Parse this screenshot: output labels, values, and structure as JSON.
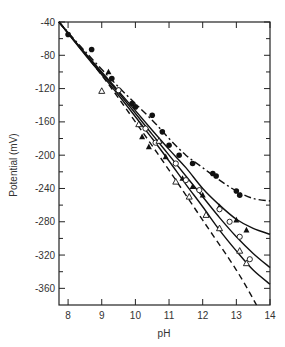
{
  "chart_data": {
    "type": "scatter",
    "title": "",
    "xlabel": "pH",
    "ylabel": "Potential (mV)",
    "xlim": [
      7.73,
      14
    ],
    "ylim": [
      -380,
      -40
    ],
    "xticks": [
      8,
      9,
      10,
      11,
      12,
      13,
      14
    ],
    "yticks": [
      -40,
      -80,
      -120,
      -160,
      -200,
      -240,
      -280,
      -320,
      -360
    ],
    "grid": false,
    "legend": null,
    "series": [
      {
        "name": "filled circles",
        "marker": "filled-circle",
        "points": [
          [
            8.0,
            -55
          ],
          [
            8.7,
            -73
          ],
          [
            9.3,
            -108
          ],
          [
            9.5,
            -122
          ],
          [
            9.9,
            -138
          ],
          [
            10.0,
            -142
          ],
          [
            10.5,
            -152
          ],
          [
            10.8,
            -172
          ],
          [
            11.0,
            -188
          ],
          [
            11.3,
            -200
          ],
          [
            11.7,
            -210
          ],
          [
            12.3,
            -222
          ],
          [
            12.4,
            -225
          ],
          [
            13.0,
            -243
          ],
          [
            13.1,
            -248
          ]
        ],
        "curve": {
          "style": "dash-dot",
          "points": [
            [
              7.73,
              -40
            ],
            [
              8.5,
              -75
            ],
            [
              9.5,
              -118
            ],
            [
              10.5,
              -158
            ],
            [
              11.0,
              -180
            ],
            [
              11.5,
              -200
            ],
            [
              12.0,
              -215
            ],
            [
              12.5,
              -230
            ],
            [
              13.0,
              -243
            ],
            [
              13.5,
              -252
            ],
            [
              14.0,
              -255
            ]
          ]
        }
      },
      {
        "name": "filled triangles",
        "marker": "filled-triangle",
        "points": [
          [
            9.2,
            -100
          ],
          [
            10.2,
            -178
          ],
          [
            10.4,
            -190
          ],
          [
            10.9,
            -202
          ],
          [
            11.4,
            -228
          ],
          [
            11.7,
            -238
          ],
          [
            12.0,
            -248
          ],
          [
            12.5,
            -262
          ],
          [
            13.0,
            -278
          ],
          [
            13.3,
            -290
          ]
        ],
        "curve": {
          "style": "solid",
          "points": [
            [
              7.73,
              -40
            ],
            [
              8.5,
              -77
            ],
            [
              9.5,
              -123
            ],
            [
              10.5,
              -170
            ],
            [
              11.0,
              -193
            ],
            [
              11.5,
              -215
            ],
            [
              12.0,
              -240
            ],
            [
              12.5,
              -260
            ],
            [
              13.0,
              -277
            ],
            [
              13.5,
              -288
            ],
            [
              14.0,
              -295
            ]
          ]
        }
      },
      {
        "name": "open circles",
        "marker": "open-circle",
        "points": [
          [
            9.5,
            -122
          ],
          [
            10.3,
            -168
          ],
          [
            10.6,
            -185
          ],
          [
            11.2,
            -210
          ],
          [
            11.5,
            -230
          ],
          [
            11.9,
            -242
          ],
          [
            12.5,
            -265
          ],
          [
            12.8,
            -280
          ],
          [
            13.1,
            -298
          ],
          [
            13.4,
            -325
          ]
        ],
        "curve": {
          "style": "solid",
          "points": [
            [
              7.73,
              -40
            ],
            [
              8.5,
              -78
            ],
            [
              9.5,
              -125
            ],
            [
              10.5,
              -175
            ],
            [
              11.0,
              -200
            ],
            [
              11.5,
              -225
            ],
            [
              12.0,
              -250
            ],
            [
              12.5,
              -275
            ],
            [
              13.0,
              -298
            ],
            [
              13.5,
              -318
            ],
            [
              14.0,
              -335
            ]
          ]
        }
      },
      {
        "name": "open triangles",
        "marker": "open-triangle",
        "points": [
          [
            9.0,
            -123
          ],
          [
            10.1,
            -163
          ],
          [
            10.7,
            -183
          ],
          [
            11.2,
            -232
          ],
          [
            11.6,
            -250
          ],
          [
            12.1,
            -272
          ],
          [
            12.5,
            -288
          ],
          [
            13.1,
            -315
          ],
          [
            13.3,
            -330
          ]
        ],
        "curve": {
          "style": "solid",
          "points": [
            [
              7.73,
              -40
            ],
            [
              8.5,
              -79
            ],
            [
              9.5,
              -128
            ],
            [
              10.5,
              -180
            ],
            [
              11.0,
              -207
            ],
            [
              11.5,
              -235
            ],
            [
              12.0,
              -262
            ],
            [
              12.5,
              -290
            ],
            [
              13.0,
              -315
            ],
            [
              13.5,
              -338
            ],
            [
              14.0,
              -355
            ]
          ]
        }
      },
      {
        "name": "theoretical (dashed)",
        "marker": "none",
        "points": [],
        "curve": {
          "style": "dashed",
          "points": [
            [
              7.73,
              -40
            ],
            [
              9.0,
              -104
            ],
            [
              10.0,
              -160
            ],
            [
              11.0,
              -218
            ],
            [
              12.0,
              -278
            ],
            [
              13.0,
              -338
            ],
            [
              13.6,
              -380
            ]
          ]
        }
      }
    ]
  },
  "axes": {
    "x_label": "pH",
    "y_label": "Potential (mV)",
    "x_tick_labels": [
      "8",
      "9",
      "10",
      "11",
      "12",
      "13",
      "14"
    ],
    "y_tick_labels": [
      "-40",
      "-80",
      "-120",
      "-160",
      "-200",
      "-240",
      "-280",
      "-320",
      "-360"
    ]
  }
}
